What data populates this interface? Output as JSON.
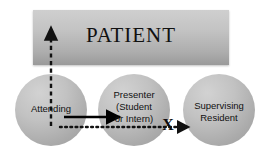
{
  "diagram": {
    "patient_box": {
      "label": "PATIENT",
      "fill_top_color": "#cfcfcf",
      "fill_bottom_color": "#9a9a9a"
    },
    "nodes": [
      {
        "id": "attending",
        "label": "Attending",
        "shape": "circle",
        "fill_color": "#c2c2c2"
      },
      {
        "id": "presenter",
        "label": "Presenter\n(Student\nor Intern)",
        "shape": "circle",
        "fill_color": "#c2c2c2"
      },
      {
        "id": "resident",
        "label": "Supervising\nResident",
        "shape": "circle",
        "fill_color": "#c2c2c2"
      }
    ],
    "connectors": [
      {
        "id": "attending-to-patient",
        "style": "dashed",
        "direction": "up",
        "color": "#111111"
      },
      {
        "id": "attending-to-presenter",
        "style": "solid",
        "direction": "right",
        "color": "#000000"
      },
      {
        "id": "attending-to-resident",
        "style": "dotted",
        "direction": "right",
        "color": "#111111"
      }
    ],
    "block_marker": {
      "label": "X",
      "color": "#0d0d0d"
    },
    "background_color": "#ffffff"
  }
}
